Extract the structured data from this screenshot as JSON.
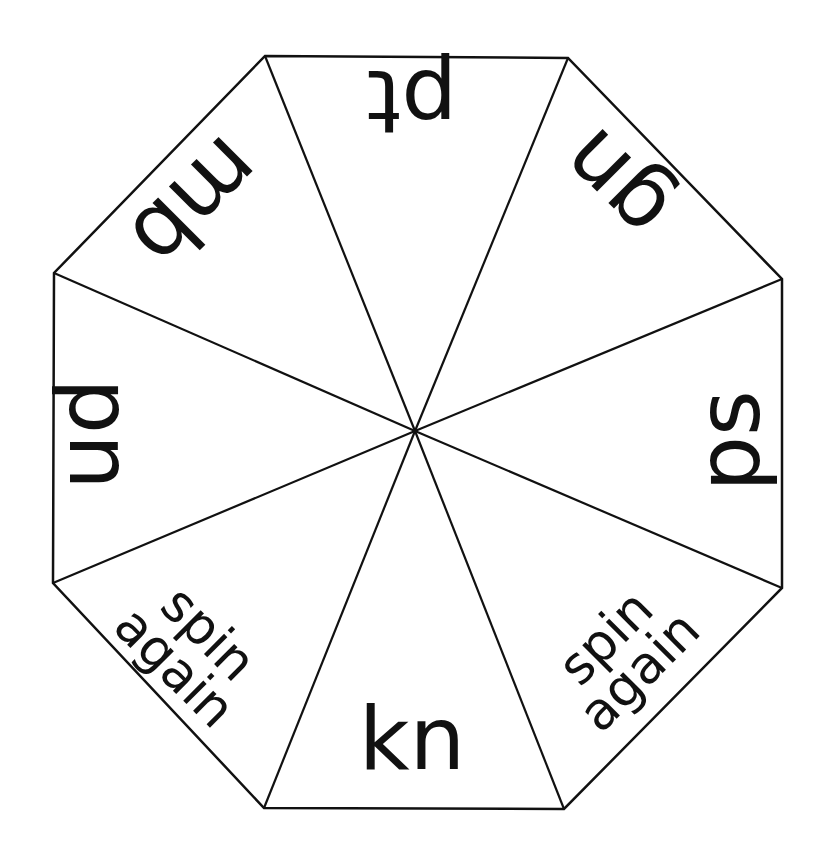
{
  "spinner": {
    "title": "Silent letters spinner",
    "stroke_color": "#111111",
    "fill_color": "#ffffff",
    "center": [
      415,
      431
    ],
    "vertices": [
      [
        265,
        56
      ],
      [
        568,
        58
      ],
      [
        782,
        279
      ],
      [
        782,
        588
      ],
      [
        564,
        809
      ],
      [
        264,
        808
      ],
      [
        53,
        583
      ],
      [
        54,
        273
      ]
    ],
    "segments": [
      {
        "label": "pt",
        "lines": [
          "pt"
        ],
        "x": 412,
        "y": 102,
        "rotate": 180,
        "size": 88
      },
      {
        "label": "gn",
        "lines": [
          "gn"
        ],
        "x": 615,
        "y": 185,
        "rotate": 225,
        "size": 88
      },
      {
        "label": "ps",
        "lines": [
          "ps"
        ],
        "x": 728,
        "y": 441,
        "rotate": -90,
        "size": 88
      },
      {
        "label": "spin again",
        "lines": [
          "spin",
          "again"
        ],
        "x": 622,
        "y": 654,
        "rotate": -45,
        "size": 52
      },
      {
        "label": "kn",
        "lines": [
          "kn"
        ],
        "x": 412,
        "y": 738,
        "rotate": 0,
        "size": 88
      },
      {
        "label": "spin again",
        "lines": [
          "spin",
          "again"
        ],
        "x": 192,
        "y": 650,
        "rotate": 45,
        "size": 52
      },
      {
        "label": "pn",
        "lines": [
          "pn"
        ],
        "x": 101,
        "y": 434,
        "rotate": 90,
        "size": 88
      },
      {
        "label": "mb",
        "lines": [
          "mb"
        ],
        "x": 196,
        "y": 203,
        "rotate": 135,
        "size": 88
      }
    ]
  }
}
